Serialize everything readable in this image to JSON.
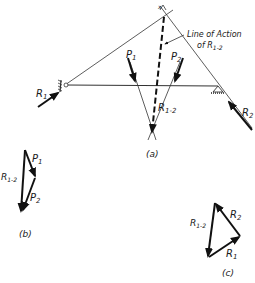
{
  "figure": {
    "part_a": {
      "caption": "(a)",
      "annotation_line1": "Line of Action",
      "annotation_line2": "of R",
      "annotation_sub": "1-2",
      "top_point_label": "x",
      "forces": {
        "p1": {
          "name": "P",
          "sub": "1"
        },
        "p2": {
          "name": "P",
          "sub": "2"
        },
        "r1": {
          "name": "R",
          "sub": "1"
        },
        "r2": {
          "name": "R",
          "sub": "2"
        },
        "r12": {
          "name": "R",
          "sub": "1-2"
        }
      }
    },
    "part_b": {
      "caption": "(b)",
      "labels": {
        "p1": {
          "name": "P",
          "sub": "1"
        },
        "p2": {
          "name": "P",
          "sub": "2"
        },
        "r12": {
          "name": "R",
          "sub": "1-2"
        }
      }
    },
    "part_c": {
      "caption": "(c)",
      "labels": {
        "r1": {
          "name": "R",
          "sub": "1"
        },
        "r2": {
          "name": "R",
          "sub": "2"
        },
        "r12": {
          "name": "R",
          "sub": "1-2"
        }
      }
    }
  }
}
